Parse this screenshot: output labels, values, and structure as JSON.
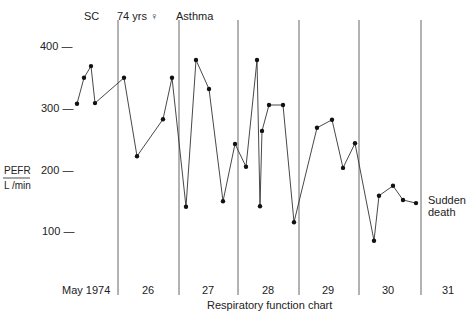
{
  "chart_data": {
    "type": "line",
    "title": "Respiratory function chart",
    "xlabel": "",
    "ylabel": "PEFR L/min",
    "ylabel_top": "PEFR",
    "ylabel_bottom": "L /min",
    "ylim": [
      50,
      440
    ],
    "yticks": [
      100,
      200,
      300,
      400
    ],
    "ytick_labels": [
      "100 —",
      "200 —",
      "300 —",
      "400 —"
    ],
    "grid": false,
    "period_labels": [
      "May 1974",
      "26",
      "27",
      "28",
      "29",
      "30",
      "31"
    ],
    "annotations": {
      "top": [
        "SC",
        "74 yrs ♀",
        "Asthma"
      ],
      "end": [
        "Sudden",
        "death"
      ]
    },
    "series": [
      {
        "name": "PEFR",
        "points": [
          {
            "x": 77,
            "y": 308
          },
          {
            "x": 84,
            "y": 350
          },
          {
            "x": 91,
            "y": 369
          },
          {
            "x": 95,
            "y": 309
          },
          {
            "x": 124,
            "y": 350
          },
          {
            "x": 137,
            "y": 223
          },
          {
            "x": 163,
            "y": 283
          },
          {
            "x": 172,
            "y": 350
          },
          {
            "x": 186,
            "y": 141
          },
          {
            "x": 196,
            "y": 379
          },
          {
            "x": 209,
            "y": 332
          },
          {
            "x": 223,
            "y": 150
          },
          {
            "x": 235,
            "y": 243
          },
          {
            "x": 246,
            "y": 206
          },
          {
            "x": 257,
            "y": 379
          },
          {
            "x": 260,
            "y": 142
          },
          {
            "x": 262,
            "y": 264
          },
          {
            "x": 269,
            "y": 306
          },
          {
            "x": 283,
            "y": 306
          },
          {
            "x": 294,
            "y": 116
          },
          {
            "x": 317,
            "y": 269
          },
          {
            "x": 332,
            "y": 282
          },
          {
            "x": 343,
            "y": 204
          },
          {
            "x": 355,
            "y": 244
          },
          {
            "x": 374,
            "y": 86
          },
          {
            "x": 379,
            "y": 159
          },
          {
            "x": 393,
            "y": 175
          },
          {
            "x": 403,
            "y": 152
          },
          {
            "x": 416,
            "y": 147
          }
        ]
      }
    ],
    "dividers_x": [
      118,
      179,
      238,
      299,
      359,
      421
    ]
  },
  "colors": {
    "line": "#333333",
    "marker": "#111111",
    "divider": "#555555"
  }
}
